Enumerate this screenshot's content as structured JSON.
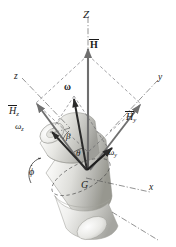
{
  "figure": {
    "kind": "engineering-mechanics-diagram",
    "background_color": "#ffffff",
    "line_color": "#1a1a1a",
    "body_fill_light": "#f2f2f0",
    "body_fill_mid": "#d8d8d4",
    "body_fill_dark": "#a8a8a4"
  },
  "labels": {
    "axis_Z": "Z",
    "axis_x": "x",
    "axis_y": "y",
    "axis_z": "z",
    "vector_H": "H",
    "vector_H_y": "H",
    "vector_H_y_sub": "y",
    "vector_H_z": "H",
    "vector_H_z_sub": "z",
    "vector_omega": "ω",
    "omega_y": "ω",
    "omega_y_sub": "y",
    "omega_z": "ω",
    "omega_z_sub": "z",
    "angle_theta": "θ",
    "angle_beta": "β",
    "precession_phi_dot": "ϕ",
    "center_of_mass": "G"
  },
  "elements": {
    "z_axis_line": "vertical dash-dot reference axis Z",
    "body_axis_line": "dash-dot spin axis through body, lower-right direction",
    "parallelogram": "dashed vector-component parallelogram for H",
    "omega_parallel_lines": "dashed component construction for omega",
    "precession_arc_arrow": "curved arrow indicating precession rate phi-dot",
    "body": "two-section tapered cylindrical rotor, shaded"
  }
}
